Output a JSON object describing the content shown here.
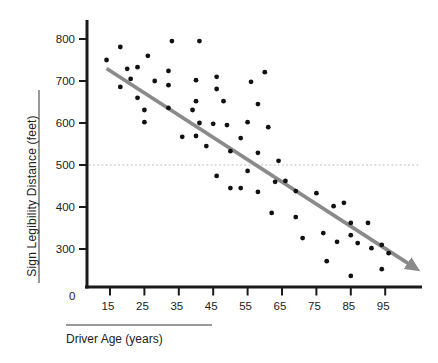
{
  "chart_data": {
    "type": "scatter",
    "title": "",
    "xlabel": "Driver Age (years)",
    "ylabel": "Sign Legibility Distance (feet)",
    "x_origin_label": "0",
    "x_ticks": [
      15,
      25,
      35,
      45,
      55,
      65,
      75,
      85,
      95
    ],
    "y_ticks": [
      300,
      400,
      500,
      600,
      700,
      800
    ],
    "xlim": [
      8,
      106
    ],
    "ylim": [
      210,
      845
    ],
    "grid": "off",
    "legend": "none",
    "reference_line_y": 500,
    "points": [
      [
        18,
        781
      ],
      [
        14,
        750
      ],
      [
        33,
        795
      ],
      [
        41,
        795
      ],
      [
        26,
        760
      ],
      [
        20,
        729
      ],
      [
        23,
        733
      ],
      [
        21,
        705
      ],
      [
        18,
        686
      ],
      [
        23,
        660
      ],
      [
        28,
        700
      ],
      [
        32,
        724
      ],
      [
        32,
        690
      ],
      [
        40,
        702
      ],
      [
        40,
        652
      ],
      [
        46,
        710
      ],
      [
        46,
        681
      ],
      [
        56,
        698
      ],
      [
        60,
        721
      ],
      [
        48,
        652
      ],
      [
        58,
        645
      ],
      [
        25,
        631
      ],
      [
        32,
        636
      ],
      [
        25,
        602
      ],
      [
        39,
        631
      ],
      [
        41,
        600
      ],
      [
        45,
        598
      ],
      [
        49,
        595
      ],
      [
        40,
        569
      ],
      [
        36,
        567
      ],
      [
        43,
        545
      ],
      [
        50,
        533
      ],
      [
        53,
        564
      ],
      [
        55,
        602
      ],
      [
        61,
        590
      ],
      [
        58,
        529
      ],
      [
        64,
        510
      ],
      [
        46,
        474
      ],
      [
        55,
        486
      ],
      [
        63,
        460
      ],
      [
        66,
        462
      ],
      [
        50,
        445
      ],
      [
        53,
        445
      ],
      [
        58,
        436
      ],
      [
        69,
        438
      ],
      [
        75,
        433
      ],
      [
        62,
        386
      ],
      [
        69,
        376
      ],
      [
        71,
        326
      ],
      [
        80,
        402
      ],
      [
        83,
        410
      ],
      [
        85,
        362
      ],
      [
        90,
        362
      ],
      [
        77,
        338
      ],
      [
        81,
        317
      ],
      [
        85,
        333
      ],
      [
        87,
        314
      ],
      [
        91,
        302
      ],
      [
        94,
        310
      ],
      [
        96,
        290
      ],
      [
        78,
        271
      ],
      [
        85,
        236
      ],
      [
        94,
        252
      ]
    ],
    "trend_line": {
      "x1": 14,
      "y1": 730,
      "x2": 102,
      "y2": 264,
      "arrow_end": true
    },
    "colors": {
      "point": "#111111",
      "axis": "#1a1a1a",
      "trend": "#8a8a8a",
      "reference": "#b5b5b5",
      "label_rule": "#999999"
    }
  }
}
